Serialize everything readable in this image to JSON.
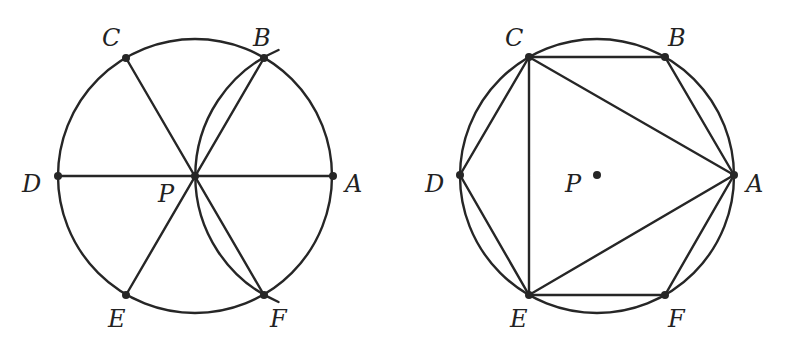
{
  "figures": [
    {
      "id": "left",
      "description": "Circle centered at P with six points A-F at 60 degree spacing, diameters AD, BE, CF, and an arc centered at A through B, P, F",
      "circle": {
        "cx": 195,
        "cy": 176,
        "r": 137
      },
      "arc": {
        "center_point": "A",
        "through": [
          "B",
          "P",
          "F"
        ]
      },
      "points": [
        {
          "label": "A",
          "x": 333,
          "y": 176
        },
        {
          "label": "B",
          "x": 264,
          "y": 58
        },
        {
          "label": "C",
          "x": 126,
          "y": 58
        },
        {
          "label": "D",
          "x": 58,
          "y": 176
        },
        {
          "label": "E",
          "x": 126,
          "y": 295
        },
        {
          "label": "F",
          "x": 264,
          "y": 295
        },
        {
          "label": "P",
          "x": 195,
          "y": 176
        }
      ],
      "segments": [
        [
          "D",
          "A"
        ],
        [
          "C",
          "F"
        ],
        [
          "E",
          "B"
        ]
      ]
    },
    {
      "id": "right",
      "description": "Regular hexagon ABCDEF inscribed in circle centered at P, with equilateral triangle ACE",
      "circle": {
        "cx": 597,
        "cy": 176,
        "r": 137
      },
      "points": [
        {
          "label": "A",
          "x": 734,
          "y": 175
        },
        {
          "label": "B",
          "x": 665,
          "y": 57
        },
        {
          "label": "C",
          "x": 529,
          "y": 57
        },
        {
          "label": "D",
          "x": 460,
          "y": 175
        },
        {
          "label": "E",
          "x": 529,
          "y": 295
        },
        {
          "label": "F",
          "x": 665,
          "y": 295
        },
        {
          "label": "P",
          "x": 597,
          "y": 175
        }
      ],
      "segments": [
        [
          "A",
          "B"
        ],
        [
          "B",
          "C"
        ],
        [
          "C",
          "D"
        ],
        [
          "D",
          "E"
        ],
        [
          "E",
          "F"
        ],
        [
          "F",
          "A"
        ],
        [
          "A",
          "C"
        ],
        [
          "C",
          "E"
        ],
        [
          "E",
          "A"
        ]
      ]
    }
  ],
  "labels": {
    "left": {
      "A": "A",
      "B": "B",
      "C": "C",
      "D": "D",
      "E": "E",
      "F": "F",
      "P": "P"
    },
    "right": {
      "A": "A",
      "B": "B",
      "C": "C",
      "D": "D",
      "E": "E",
      "F": "F",
      "P": "P"
    }
  },
  "colors": {
    "ink": "#262626",
    "background": "#ffffff"
  }
}
